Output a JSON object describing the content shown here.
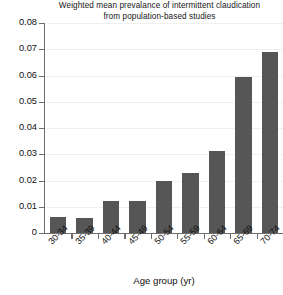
{
  "chart_data": {
    "type": "bar",
    "title": "Weighted mean prevalance of intermittent claudication from population-based studies",
    "title_line1": "Weighted mean prevalance of intermittent claudication",
    "title_line2": "from population-based studies",
    "xlabel": "Age group (yr)",
    "ylabel": "",
    "categories": [
      "30-34",
      "35-39",
      "40-44",
      "45-49",
      "50-54",
      "55-59",
      "60-64",
      "65-69",
      "70-74"
    ],
    "values": [
      0.006,
      0.0058,
      0.0122,
      0.0121,
      0.02,
      0.0228,
      0.0313,
      0.0595,
      0.0688
    ],
    "ylim": [
      0,
      0.08
    ],
    "ytick_labels": [
      "0.08",
      "0.07",
      "0.06",
      "0.05",
      "0.04",
      "0.03",
      "0.02",
      "0.01",
      "0"
    ],
    "ytick_values": [
      0.08,
      0.07,
      0.06,
      0.05,
      0.04,
      0.03,
      0.02,
      0.01,
      0
    ],
    "grid": true,
    "legend": false,
    "bar_color": "#565656",
    "axis_color": "#6e6e6e",
    "gridline_color": "#f0f0f0",
    "background_color": "#ffffff"
  }
}
